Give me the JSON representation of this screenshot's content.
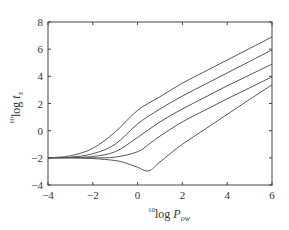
{
  "chart_data": {
    "type": "line",
    "title": "",
    "xlabel": {
      "prefix_sup": "10",
      "text": "log ",
      "var": "P",
      "sub": "ow"
    },
    "ylabel": {
      "prefix_sup": "10",
      "text": "log ",
      "var": "t",
      "sub": "x"
    },
    "xlim": [
      -4,
      6
    ],
    "ylim": [
      -4,
      8
    ],
    "xticks": [
      -4,
      -2,
      0,
      2,
      4,
      6
    ],
    "yticks": [
      -4,
      -2,
      0,
      2,
      4,
      6,
      8
    ],
    "xtick_labels": [
      "−4",
      "−2",
      "0",
      "2",
      "4",
      "6"
    ],
    "ytick_labels": [
      "−4",
      "−2",
      "0",
      "2",
      "4",
      "6",
      "8"
    ],
    "grid": false,
    "legend": null,
    "line_color": "#555555",
    "series": [
      {
        "name": "curve-1",
        "x": [
          -4,
          -3,
          -2,
          -1,
          0,
          1,
          2,
          3,
          4,
          5,
          6
        ],
        "y": [
          -2,
          -1.85,
          -1.3,
          -0.1,
          1.5,
          2.5,
          3.5,
          4.35,
          5.2,
          6.05,
          6.9
        ]
      },
      {
        "name": "curve-2",
        "x": [
          -4,
          -3,
          -2,
          -1,
          0,
          1,
          2,
          3,
          4,
          5,
          6
        ],
        "y": [
          -2,
          -1.95,
          -1.7,
          -1.0,
          0.5,
          1.6,
          2.55,
          3.4,
          4.25,
          5.1,
          5.95
        ]
      },
      {
        "name": "curve-3",
        "x": [
          -4,
          -3,
          -2,
          -1,
          0,
          1,
          2,
          3,
          4,
          5,
          6
        ],
        "y": [
          -2,
          -1.98,
          -1.9,
          -1.55,
          -0.5,
          0.65,
          1.6,
          2.45,
          3.3,
          4.1,
          4.9
        ]
      },
      {
        "name": "curve-4",
        "x": [
          -4,
          -3,
          -2,
          -1,
          0,
          0.5,
          1,
          2,
          3,
          4,
          5,
          6
        ],
        "y": [
          -2,
          -2.0,
          -2.0,
          -1.95,
          -1.55,
          -1.0,
          -0.4,
          0.65,
          1.5,
          2.35,
          3.15,
          3.96
        ]
      },
      {
        "name": "curve-5",
        "x": [
          -4,
          -3,
          -2,
          -1,
          -0.5,
          0,
          0.5,
          1,
          2,
          3,
          4,
          5,
          6
        ],
        "y": [
          -2,
          -2.0,
          -2.05,
          -2.2,
          -2.4,
          -2.7,
          -2.96,
          -2.3,
          -1.0,
          0.1,
          1.2,
          2.3,
          3.37
        ]
      }
    ]
  }
}
